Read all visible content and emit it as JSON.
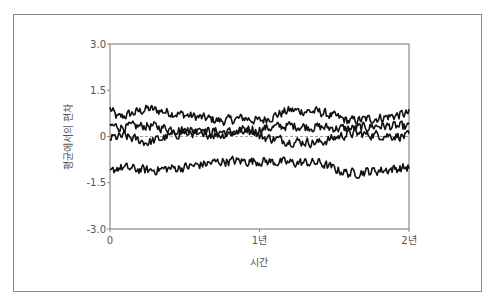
{
  "chart_data": {
    "type": "line",
    "title": "",
    "xlabel": "시간",
    "ylabel": "평균에서의 편차",
    "xlim": [
      0,
      2
    ],
    "ylim": [
      -3.0,
      3.0
    ],
    "x_ticks": [
      {
        "value": 0,
        "label": "0"
      },
      {
        "value": 1,
        "label": "1년"
      },
      {
        "value": 2,
        "label": "2년"
      }
    ],
    "y_ticks": [
      {
        "value": 3.0,
        "label": "3.0"
      },
      {
        "value": 1.5,
        "label": "1.5"
      },
      {
        "value": 0,
        "label": "0"
      },
      {
        "value": -1.5,
        "label": "-1.5"
      },
      {
        "value": -3.0,
        "label": "-3.0"
      }
    ],
    "reference_line": {
      "y": 0,
      "style": "dashed",
      "color": "#888888"
    },
    "grid": false,
    "legend": null,
    "line_color": "#111111",
    "series": [
      {
        "name": "series-1",
        "x": [
          0,
          0.05,
          0.25,
          0.5,
          0.75,
          0.9,
          1.0,
          1.2,
          1.4,
          1.6,
          1.8,
          2.0
        ],
        "values": [
          0.9,
          0.6,
          0.9,
          0.7,
          0.5,
          0.6,
          0.5,
          0.85,
          0.8,
          0.5,
          0.6,
          0.75
        ]
      },
      {
        "name": "series-2",
        "x": [
          0,
          0.1,
          0.25,
          0.5,
          0.75,
          0.95,
          1.0,
          1.2,
          1.4,
          1.6,
          1.8,
          2.0
        ],
        "values": [
          0.35,
          0.3,
          0.35,
          0.2,
          0.15,
          0.1,
          0.25,
          0.35,
          0.3,
          0.25,
          0.35,
          0.3
        ]
      },
      {
        "name": "series-3",
        "x": [
          0,
          0.1,
          0.25,
          0.5,
          0.75,
          0.95,
          1.0,
          1.2,
          1.4,
          1.6,
          1.8,
          2.0
        ],
        "values": [
          -0.05,
          0.0,
          -0.2,
          0.15,
          0.05,
          0.3,
          0.0,
          -0.15,
          -0.2,
          0.1,
          0.05,
          0.0
        ]
      },
      {
        "name": "series-4",
        "x": [
          0,
          0.05,
          0.25,
          0.5,
          0.75,
          1.0,
          1.2,
          1.4,
          1.5,
          1.6,
          1.8,
          2.0
        ],
        "values": [
          -1.2,
          -1.0,
          -1.1,
          -1.0,
          -0.8,
          -0.8,
          -0.85,
          -0.85,
          -1.05,
          -1.2,
          -1.1,
          -1.0
        ]
      }
    ]
  }
}
